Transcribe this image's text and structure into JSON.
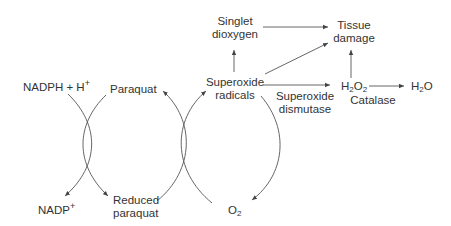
{
  "diagram": {
    "title": "",
    "nodes": {
      "nadph": {
        "main": "NADPH + H",
        "sup": "+"
      },
      "nadp": {
        "main": "NADP",
        "sup": "+"
      },
      "paraquat": {
        "label": "Paraquat"
      },
      "reduced_paraquat": {
        "line1": "Reduced",
        "line2": "paraquat"
      },
      "superoxide_radicals": {
        "line1": "Superoxide",
        "line2": "radicals"
      },
      "o2": {
        "main": "O",
        "sub": "2"
      },
      "singlet_dioxygen": {
        "line1": "Singlet",
        "line2": "dioxygen"
      },
      "tissue_damage": {
        "line1": "Tissue",
        "line2": "damage"
      },
      "h2o2": {
        "a": "H",
        "sub1": "2",
        "b": "O",
        "sub2": "2"
      },
      "h2o": {
        "a": "H",
        "sub1": "2",
        "b": "O"
      }
    },
    "enzymes": {
      "superoxide_dismutase": {
        "line1": "Superoxide",
        "line2": "dismutase"
      },
      "catalase": {
        "label": "Catalase"
      }
    },
    "edges": [
      {
        "from": "NADPH + H+",
        "to": "NADP+",
        "style": "curved"
      },
      {
        "from": "Reduced paraquat",
        "to": "Paraquat",
        "style": "curved"
      },
      {
        "from": "Paraquat",
        "to": "Reduced paraquat",
        "style": "curved"
      },
      {
        "from": "O2",
        "to": "Superoxide radicals",
        "style": "curved"
      },
      {
        "from": "Superoxide radicals",
        "to": "O2",
        "style": "curved"
      },
      {
        "from": "Superoxide radicals",
        "to": "Singlet dioxygen",
        "style": "straight"
      },
      {
        "from": "Singlet dioxygen",
        "to": "Tissue damage",
        "style": "straight"
      },
      {
        "from": "Superoxide radicals",
        "to": "Tissue damage",
        "style": "straight"
      },
      {
        "from": "Superoxide radicals",
        "to": "H2O2",
        "label": "Superoxide dismutase",
        "style": "straight"
      },
      {
        "from": "H2O2",
        "to": "Tissue damage",
        "style": "straight"
      },
      {
        "from": "H2O2",
        "to": "H2O",
        "label": "Catalase",
        "style": "straight"
      }
    ],
    "colors": {
      "line": "#555555",
      "text": "#333333",
      "background": "#ffffff"
    }
  }
}
